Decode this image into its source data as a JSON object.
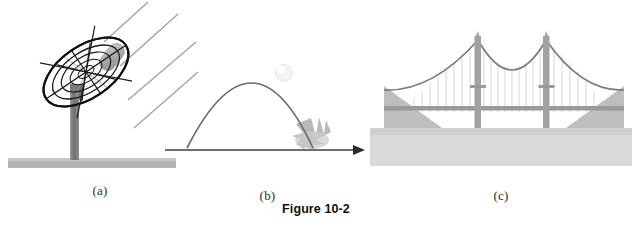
{
  "figure": {
    "caption": "Figure 10-2",
    "background_color": "#ffffff"
  },
  "panels": [
    {
      "id": "a",
      "label": "(a)",
      "subject": "satellite-dish",
      "description": "Parabolic satellite dish antenna on a pedestal with incoming parallel rays",
      "elements": {
        "dish_mesh_color": "#1a1a1a",
        "dish_inner_line_color": "#8f8f8f",
        "feed_horn_color": "#a8a8a8",
        "pedestal_color": "#808080",
        "base_slab_color": "#b5b5b5",
        "ray_color": "#9a9a9a",
        "ray_count": 4
      }
    },
    {
      "id": "b",
      "label": "(b)",
      "subject": "projectile-trajectory",
      "description": "Parabolic projectile path of a ball landing on the ground with a splash",
      "elements": {
        "trajectory_color": "#6b6b6b",
        "ball_color": "#f2f2f2",
        "splash_color": "#b8b8b8",
        "axis_color": "#6e6e6e",
        "arrow_color": "#2b2b2b"
      }
    },
    {
      "id": "c",
      "label": "(c)",
      "subject": "suspension-bridge",
      "description": "Suspension bridge with two towers, catenary main cables and vertical suspenders over water",
      "elements": {
        "cable_color": "#7d7d7d",
        "suspender_color": "#c2c2c2",
        "tower_color": "#a0a0a0",
        "deck_color": "#9a9a9a",
        "hillside_color": "#bcbcbc",
        "water_color": "#d6d6d6",
        "tower_count": 2
      }
    }
  ]
}
